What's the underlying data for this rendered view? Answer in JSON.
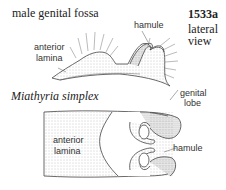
{
  "figure": {
    "heading": "male genital fossa",
    "number": "1533a",
    "view_line1": "lateral",
    "view_line2": "view",
    "species": "Miathyria simplex"
  },
  "labels": {
    "top_hamule": "hamule",
    "top_anterior_1": "anterior",
    "top_anterior_2": "lamina",
    "genital_1": "genital",
    "genital_2": "lobe",
    "bottom_anterior_1": "anterior",
    "bottom_anterior_2": "lamina",
    "bottom_hamule": "hamule"
  },
  "colors": {
    "ink": "#333333",
    "stipple": "#9a9a9a",
    "background": "#ffffff"
  }
}
